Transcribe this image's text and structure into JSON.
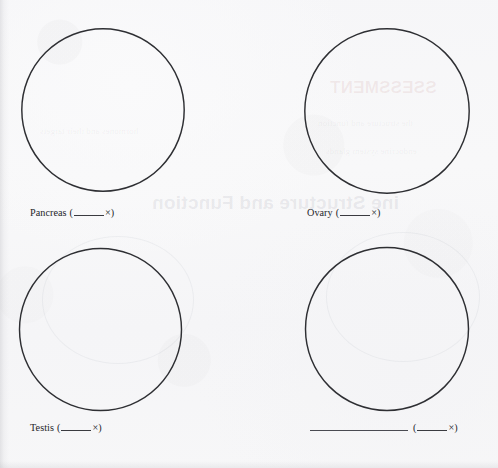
{
  "document": {
    "type": "histology-drawing-worksheet",
    "page_background": "#f7f7f8",
    "ink_color": "#2e2f33",
    "circle_count": 4
  },
  "bleed_through": {
    "note": "Faint mirrored show-through text from the reverse side of the sheet",
    "items": [
      {
        "text": "SSESSMENT",
        "style": "red-heading"
      },
      {
        "text": "ine Structure and Function",
        "style": "heading"
      },
      {
        "text": "the structure and function",
        "style": "body"
      },
      {
        "text": "endocrine system glands",
        "style": "body"
      },
      {
        "text": "hormones and their targets",
        "style": "body"
      }
    ]
  },
  "drawings": [
    {
      "id": "drawing-pancreas",
      "label": "Pancreas",
      "magnification_prefix": "(",
      "magnification_value": "",
      "magnification_unit": "×",
      "magnification_suffix": ")",
      "has_name_blank": false
    },
    {
      "id": "drawing-ovary",
      "label": "Ovary",
      "magnification_prefix": "(",
      "magnification_value": "",
      "magnification_unit": "×",
      "magnification_suffix": ")",
      "has_name_blank": false
    },
    {
      "id": "drawing-testis",
      "label": "Testis",
      "magnification_prefix": "(",
      "magnification_value": "",
      "magnification_unit": "×",
      "magnification_suffix": ")",
      "has_name_blank": false
    },
    {
      "id": "drawing-unlabeled",
      "label": "",
      "magnification_prefix": "(",
      "magnification_value": "",
      "magnification_unit": "×",
      "magnification_suffix": ")",
      "has_name_blank": true
    }
  ]
}
